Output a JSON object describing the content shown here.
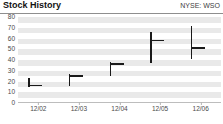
{
  "header": {
    "title": "Stock History",
    "ticker": "NYSE: WSO"
  },
  "colors": {
    "bar": "#1a1a1a",
    "band": "#e9e9e9",
    "rule": "#8e8e8e",
    "text": "#4a4a4a"
  },
  "chart_data": {
    "type": "bar",
    "title": "Stock History",
    "subtitle": "NYSE: WSO",
    "xlabel": "",
    "ylabel": "",
    "categories": [
      "12/02",
      "12/03",
      "12/04",
      "12/05",
      "12/06"
    ],
    "ylim": [
      0,
      80
    ],
    "yticks": [
      0,
      10,
      20,
      30,
      40,
      50,
      60,
      70,
      80
    ],
    "ytick_labels": [
      "0",
      "10",
      "20",
      "30",
      "40",
      "50",
      "60",
      "70",
      "80"
    ],
    "grid": true,
    "legend": "none",
    "series": [
      {
        "name": "High",
        "values": [
          23,
          27,
          38,
          66,
          72
        ]
      },
      {
        "name": "Low",
        "values": [
          15,
          16,
          25,
          37,
          41
        ]
      },
      {
        "name": "Close",
        "values": [
          17,
          26,
          37,
          59,
          52
        ]
      }
    ],
    "bars": [
      {
        "label": "12/02",
        "high": 23,
        "low": 15,
        "close": 17
      },
      {
        "label": "12/03",
        "high": 27,
        "low": 16,
        "close": 26
      },
      {
        "label": "12/04",
        "high": 38,
        "low": 25,
        "close": 37
      },
      {
        "label": "12/05",
        "high": 66,
        "low": 37,
        "close": 59
      },
      {
        "label": "12/06",
        "high": 72,
        "low": 41,
        "close": 52
      }
    ]
  }
}
